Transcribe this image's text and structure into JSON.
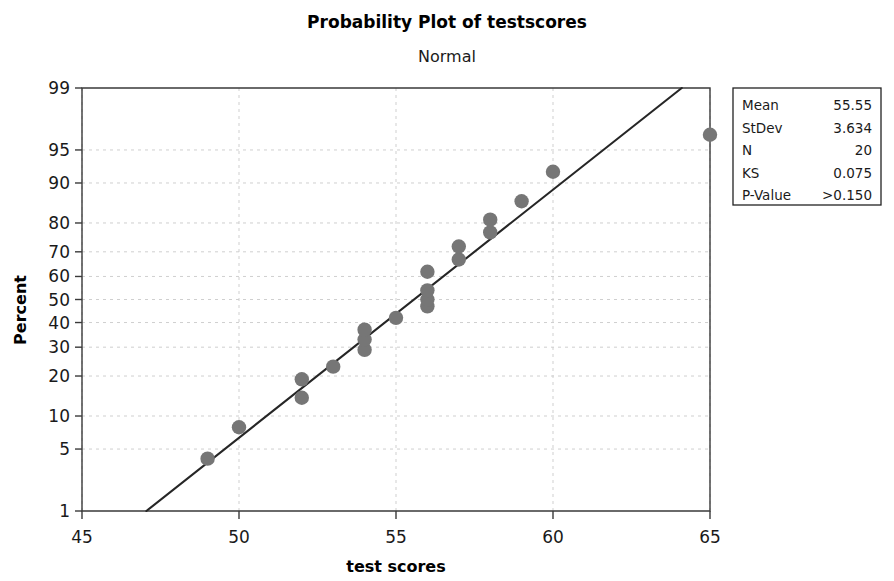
{
  "chart_data": {
    "type": "scatter",
    "title": "Probability Plot of testscores",
    "subtitle": "Normal",
    "xlabel": "test scores",
    "ylabel": "Percent",
    "xlim": [
      45,
      65
    ],
    "xticks": [
      45,
      50,
      55,
      60,
      65
    ],
    "yticks": [
      1,
      5,
      10,
      20,
      30,
      40,
      50,
      60,
      70,
      80,
      90,
      95,
      99
    ],
    "ylim": [
      1,
      99
    ],
    "yscale": "normal-probability",
    "grid": true,
    "legend": false,
    "series": [
      {
        "name": "testscores",
        "marker": "filled-circle",
        "color": "#767676",
        "x": [
          49,
          50,
          52,
          52,
          53,
          54,
          54,
          54,
          55,
          56,
          56,
          56,
          56,
          57,
          57,
          58,
          58,
          59,
          60,
          65
        ],
        "y": [
          4,
          8,
          14,
          19,
          23,
          29,
          33,
          37,
          42,
          47,
          50,
          54,
          62,
          67,
          72,
          77,
          81,
          86,
          92,
          96.5
        ]
      }
    ],
    "fit_line": {
      "name": "normal-fit",
      "color": "#262626",
      "x": [
        47.05,
        64.1
      ],
      "y": [
        1,
        99
      ]
    },
    "stats": {
      "rows": [
        {
          "label": "Mean",
          "value": "55.55"
        },
        {
          "label": "StDev",
          "value": "3.634"
        },
        {
          "label": "N",
          "value": "20"
        },
        {
          "label": "KS",
          "value": "0.075"
        },
        {
          "label": "P-Value",
          "value": ">0.150"
        }
      ]
    }
  }
}
